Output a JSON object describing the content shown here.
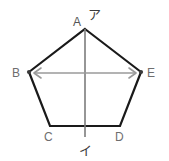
{
  "figure": {
    "type": "geometry-diagram",
    "shape": "regular-pentagon",
    "background_color": "#ffffff",
    "outline_color": "#1a1a1a",
    "axis_color": "#8a8a8a",
    "arrow_color": "#9a9a9a",
    "label_color": "#6e6e6e",
    "annotation_color": "#3a3a3a",
    "vertices": [
      {
        "id": "A",
        "label": "A",
        "x": 85,
        "y": 29,
        "label_x": 73,
        "label_y": 26
      },
      {
        "id": "B",
        "label": "B",
        "x": 29,
        "y": 72,
        "label_x": 12,
        "label_y": 77
      },
      {
        "id": "C",
        "label": "C",
        "x": 50,
        "y": 126,
        "label_x": 44,
        "label_y": 141
      },
      {
        "id": "D",
        "label": "D",
        "x": 120,
        "y": 126,
        "label_x": 115,
        "label_y": 141
      },
      {
        "id": "E",
        "label": "E",
        "x": 141,
        "y": 72,
        "label_x": 147,
        "label_y": 77
      }
    ],
    "vertical_axis": {
      "name": "vertical-axis-line",
      "x1": 85,
      "y1": 29,
      "x2": 85,
      "y2": 137
    },
    "horizontal_arrow": {
      "name": "horizontal-double-arrow",
      "x1": 33,
      "y1": 73,
      "x2": 137,
      "y2": 73,
      "double_headed": true
    },
    "annotations": [
      {
        "id": "top",
        "text": "ア",
        "x": 89,
        "y": 19
      },
      {
        "id": "bottom",
        "text": "イ",
        "x": 80,
        "y": 153
      }
    ]
  }
}
